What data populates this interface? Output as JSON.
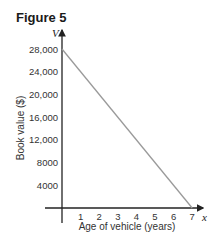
{
  "figure_label": "Figure 5",
  "chart_data": {
    "type": "line",
    "title": "Figure 5",
    "xlabel": "Age of vehicle (years)",
    "ylabel": "Book value ($)",
    "x_axis_var": "x",
    "y_axis_var": "V",
    "x_ticks": [
      "1",
      "2",
      "3",
      "4",
      "5",
      "6",
      "7"
    ],
    "y_ticks": [
      "4000",
      "8000",
      "12,000",
      "16,000",
      "20,000",
      "24,000",
      "28,000"
    ],
    "xlim": [
      0,
      7
    ],
    "ylim": [
      0,
      28000
    ],
    "grid": false,
    "series": [
      {
        "name": "Book value",
        "x": [
          0,
          7
        ],
        "values": [
          28000,
          0
        ],
        "color": "#9a9a9a"
      }
    ]
  }
}
